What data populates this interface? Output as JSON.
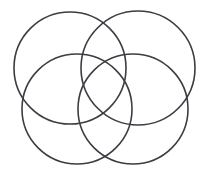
{
  "figure": {
    "width": 211,
    "height": 175,
    "background_color": "#ffffff",
    "stroke_color": "#3c3c42",
    "stroke_width": 1.6,
    "shape_count": 4,
    "shape_type": "circle",
    "fill": "none"
  },
  "shapes": [
    {
      "name": "top-left-circle",
      "label": "Top Left Circle",
      "cx": 70,
      "cy": 68,
      "r": 56,
      "stroke": "#3c3c42",
      "stroke_width": 1.6
    },
    {
      "name": "top-right-circle",
      "label": "Top Right Circle",
      "cx": 138,
      "cy": 68,
      "r": 57,
      "stroke": "#3c3c42",
      "stroke_width": 1.6
    },
    {
      "name": "bottom-left-circle",
      "label": "Bottom Left Circle",
      "cx": 77,
      "cy": 109,
      "r": 55,
      "stroke": "#3c3c42",
      "stroke_width": 1.6
    },
    {
      "name": "bottom-right-circle",
      "label": "Bottom Right Circle",
      "cx": 133,
      "cy": 109,
      "r": 55,
      "stroke": "#3c3c42",
      "stroke_width": 1.6
    }
  ]
}
